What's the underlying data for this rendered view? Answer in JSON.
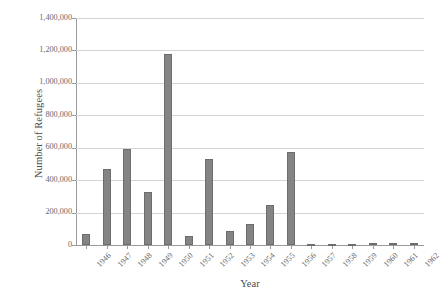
{
  "chart_data": {
    "type": "bar",
    "title": "",
    "xlabel": "Year",
    "ylabel": "Number of Refugees",
    "categories": [
      "1946",
      "1947",
      "1948",
      "1949",
      "1950",
      "1951",
      "1952",
      "1953",
      "1954",
      "1955",
      "1956",
      "1957",
      "1958",
      "1959",
      "1960",
      "1961",
      "1962"
    ],
    "values": [
      65000,
      470000,
      590000,
      325000,
      1175000,
      55000,
      530000,
      88000,
      130000,
      245000,
      575000,
      8000,
      5000,
      7000,
      12000,
      10000,
      13000
    ],
    "ylim": [
      0,
      1400000
    ],
    "ytick_values": [
      0,
      200000,
      400000,
      600000,
      800000,
      1000000,
      1200000,
      1400000
    ],
    "ytick_labels": [
      "0",
      "200,000",
      "400,000",
      "600,000",
      "800,000",
      "1,000,000",
      "1,200,000",
      "1,400,000"
    ],
    "grid": true,
    "legend": null,
    "bar_color": "#848484",
    "bar_border_color": "#6d6d6d",
    "gridline_color": "#d4d4d4",
    "axis_color": "#9a9a9a",
    "text_color": "#6a6a6a"
  }
}
